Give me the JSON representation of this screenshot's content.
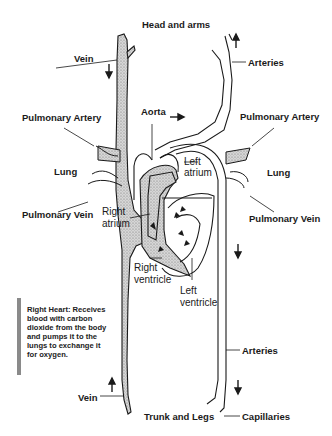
{
  "diagram": {
    "colors": {
      "line": "#1a1a1a",
      "vein_fill": "#bdbdbd",
      "note_bar": "#8a8a8a",
      "background": "#ffffff"
    },
    "labels": {
      "head_and_arms": "Head and arms",
      "vein_top": "Vein",
      "arteries_top": "Arteries",
      "aorta": "Aorta",
      "pulmonary_artery_left": "Pulmonary Artery",
      "pulmonary_artery_right": "Pulmonary Artery",
      "lung_left": "Lung",
      "lung_right": "Lung",
      "left_atrium_1": "Left",
      "left_atrium_2": "atrium",
      "pulmonary_vein_left": "Pulmonary Vein",
      "pulmonary_vein_right": "Pulmonary Vein",
      "right_atrium_1": "Right",
      "right_atrium_2": "atrium",
      "right_ventricle_1": "Right",
      "right_ventricle_2": "ventricle",
      "left_ventricle_1": "Left",
      "left_ventricle_2": "ventricle",
      "arteries_bottom": "Arteries",
      "vein_bottom": "Vein",
      "trunk_and_legs": "Trunk and Legs",
      "capillaries": "Capillaries"
    },
    "note": {
      "text": "Right Heart: Receives blood with carbon dioxide from the body and pumps it to the lungs to exchange it for oxygen."
    },
    "arrows": [
      {
        "name": "vein-top-down-arrow",
        "direction": "down"
      },
      {
        "name": "arteries-top-up-arrow",
        "direction": "up"
      },
      {
        "name": "aorta-right-arrow",
        "direction": "right"
      },
      {
        "name": "arteries-mid-down-arrow",
        "direction": "down"
      },
      {
        "name": "arteries-bottom-down-arrow",
        "direction": "down"
      },
      {
        "name": "vein-bottom-up-arrow",
        "direction": "up"
      }
    ]
  }
}
